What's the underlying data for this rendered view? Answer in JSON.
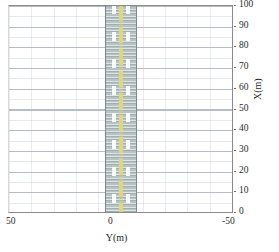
{
  "chart_data": {
    "type": "area",
    "title": "",
    "xlabel": "Y(m)",
    "ylabel": "X(m)",
    "xlim": [
      50,
      -50
    ],
    "ylim": [
      0,
      100
    ],
    "x_reversed": true,
    "y_axis_position": "right",
    "grid": true,
    "legend": null,
    "xticks": [
      50,
      0,
      -50
    ],
    "xtick_labels": [
      "50",
      "0",
      "-50"
    ],
    "yticks": [
      0,
      10,
      20,
      30,
      40,
      50,
      60,
      70,
      80,
      90,
      100
    ],
    "ytick_labels": [
      "0",
      "10",
      "20",
      "30",
      "40",
      "50",
      "60",
      "70",
      "80",
      "90",
      "100"
    ],
    "series": [
      {
        "name": "road-corridor",
        "type": "vertical-band",
        "x_range": [
          7,
          -7
        ],
        "y_range": [
          0,
          100
        ],
        "fill_color": "#b6c2c4",
        "edge_color": "#7c8a8e",
        "description": "road surface band"
      },
      {
        "name": "lane-marking-left",
        "type": "dashed-line",
        "x": 5,
        "color": "#ffffff"
      },
      {
        "name": "lane-marking-right",
        "type": "dashed-line",
        "x": -5,
        "color": "#ffffff"
      },
      {
        "name": "center-line",
        "type": "dashed-line",
        "x": 0,
        "color": "#e0d878"
      }
    ]
  },
  "axes": {
    "x": {
      "title": "Y(m)",
      "labels": {
        "left": "50",
        "mid": "0",
        "right": "-50"
      }
    },
    "y": {
      "title": "X(m)",
      "labels": [
        "100",
        "90",
        "80",
        "70",
        "60",
        "50",
        "40",
        "30",
        "20",
        "10",
        "0"
      ]
    }
  }
}
